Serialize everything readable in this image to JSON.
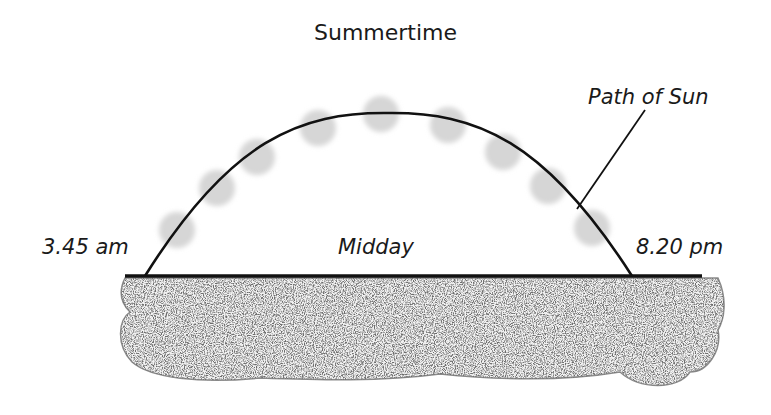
{
  "title": "Summertime",
  "labels": {
    "sunrise": "3.45 am",
    "midday": "Midday",
    "sunset": "8.20 pm",
    "path": "Path of Sun"
  },
  "colors": {
    "line": "#111111",
    "sun": "#d6d6d6",
    "ground_outline": "#8c8c8c",
    "ground_fill": "#bdbdbd"
  }
}
